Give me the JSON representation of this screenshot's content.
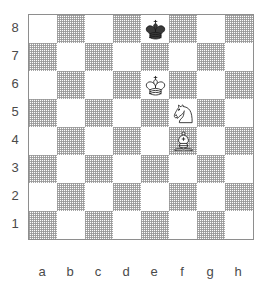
{
  "diagram": {
    "type": "chess-board",
    "orientation": "white-bottom",
    "files": [
      "a",
      "b",
      "c",
      "d",
      "e",
      "f",
      "g",
      "h"
    ],
    "ranks": [
      "8",
      "7",
      "6",
      "5",
      "4",
      "3",
      "2",
      "1"
    ],
    "colors": {
      "light_square": "#ffffff",
      "dark_square": "#9a9a9a",
      "border": "#8e8e8e",
      "label_text": "#4a4a4a",
      "piece_outline": "#1a1a1a",
      "piece_white_fill": "#ffffff",
      "piece_black_fill": "#3a3a3a",
      "page_background": "#ffffff"
    },
    "square_size_px": 28,
    "dark_square_parity": "a8-light",
    "pieces": [
      {
        "square": "e8",
        "color": "black",
        "type": "king",
        "icon": "king-icon",
        "label": "Black King on e8"
      },
      {
        "square": "e6",
        "color": "white",
        "type": "king",
        "icon": "king-icon",
        "label": "White King on e6"
      },
      {
        "square": "f5",
        "color": "white",
        "type": "knight",
        "icon": "knight-icon",
        "label": "White Knight on f5"
      },
      {
        "square": "f4",
        "color": "white",
        "type": "bishop",
        "icon": "bishop-icon",
        "label": "White Bishop on f4"
      }
    ]
  },
  "chart_data": {
    "type": "table",
    "categories": [
      "a",
      "b",
      "c",
      "d",
      "e",
      "f",
      "g",
      "h"
    ],
    "values": [
      8,
      7,
      6,
      5,
      4,
      3,
      2,
      1
    ]
  }
}
